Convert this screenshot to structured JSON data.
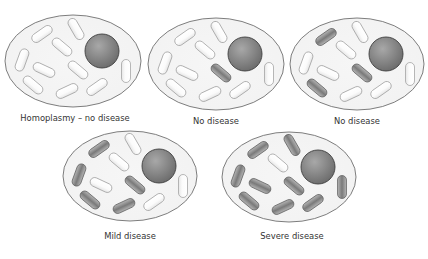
{
  "colors": {
    "background": "#ffffff",
    "cytoplasm_fill": "#f2f2f2",
    "cell_outline": "#6f6f6f",
    "nucleus_light": "#a8a8a8",
    "nucleus_dark": "#6a6a6a",
    "nucleus_outline": "#3f3f3f",
    "normal_mito_fill": "#fbfbfb",
    "normal_mito_outline": "#9a9a9a",
    "mutant_mito_light": "#b5b5b5",
    "mutant_mito_dark": "#7a7a7a",
    "mutant_mito_outline": "#5a5a5a",
    "label_text": "#333333"
  },
  "mitochondria_layout": [
    {
      "dx": -31,
      "dy": -27,
      "angle": -35
    },
    {
      "dx": 3,
      "dy": -32,
      "angle": 60
    },
    {
      "dx": -11,
      "dy": -14,
      "angle": 40
    },
    {
      "dx": -51,
      "dy": -1,
      "angle": -70
    },
    {
      "dx": -29,
      "dy": 9,
      "angle": 25
    },
    {
      "dx": 5,
      "dy": 9,
      "angle": 40
    },
    {
      "dx": -40,
      "dy": 24,
      "angle": 40
    },
    {
      "dx": -6,
      "dy": 30,
      "angle": -25
    },
    {
      "dx": 24,
      "dy": 26,
      "angle": -35
    },
    {
      "dx": 53,
      "dy": 10,
      "angle": 90
    }
  ],
  "cells": [
    {
      "id": "cell-1",
      "label": "Homoplasmy – no disease",
      "cx": 73,
      "cy": 61,
      "rx": 68,
      "ry": 46,
      "nucleus": {
        "dx": 29,
        "dy": -10,
        "r": 17
      },
      "label_x": 75,
      "label_y": 114,
      "mutant": [
        false,
        false,
        false,
        false,
        false,
        false,
        false,
        false,
        false,
        false
      ]
    },
    {
      "id": "cell-2",
      "label": "No disease",
      "cx": 216,
      "cy": 64,
      "rx": 68,
      "ry": 46,
      "nucleus": {
        "dx": 29,
        "dy": -10,
        "r": 17
      },
      "label_x": 216,
      "label_y": 117,
      "mutant": [
        false,
        false,
        false,
        false,
        false,
        true,
        false,
        false,
        false,
        false
      ]
    },
    {
      "id": "cell-3",
      "label": "No disease",
      "cx": 357,
      "cy": 64,
      "rx": 67,
      "ry": 46,
      "nucleus": {
        "dx": 29,
        "dy": -10,
        "r": 17
      },
      "label_x": 357,
      "label_y": 117,
      "mutant": [
        true,
        false,
        false,
        false,
        false,
        true,
        true,
        false,
        false,
        false
      ]
    },
    {
      "id": "cell-4",
      "label": "Mild disease",
      "cx": 130,
      "cy": 176,
      "rx": 67,
      "ry": 45,
      "nucleus": {
        "dx": 29,
        "dy": -10,
        "r": 17
      },
      "label_x": 130,
      "label_y": 232,
      "mutant": [
        true,
        false,
        false,
        true,
        false,
        true,
        true,
        true,
        false,
        false
      ]
    },
    {
      "id": "cell-5",
      "label": "Severe disease",
      "cx": 289,
      "cy": 177,
      "rx": 67,
      "ry": 45,
      "nucleus": {
        "dx": 29,
        "dy": -10,
        "r": 17
      },
      "label_x": 292,
      "label_y": 232,
      "mutant": [
        true,
        true,
        false,
        true,
        true,
        true,
        true,
        true,
        true,
        true
      ]
    }
  ],
  "mito_size": {
    "length": 23,
    "width": 9
  }
}
